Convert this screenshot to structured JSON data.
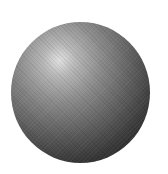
{
  "image": {
    "subject": "shaded grayscale sphere",
    "background_color": "#ffffff",
    "sphere": {
      "highlight_color": "#dcdcdc",
      "shadow_color": "#262626",
      "light_direction": "upper-left"
    }
  }
}
